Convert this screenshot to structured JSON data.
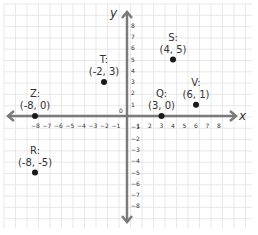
{
  "figure": {
    "x_axis_label": "x",
    "y_axis_label": "y",
    "origin_label": "0",
    "x_ticks": [
      -8,
      -7,
      -6,
      -5,
      -4,
      -3,
      -2,
      -1,
      1,
      2,
      3,
      4,
      5,
      6,
      7,
      8
    ],
    "y_ticks": [
      8,
      7,
      6,
      5,
      4,
      3,
      2,
      1,
      -1,
      -2,
      -3,
      -4,
      -5,
      -6,
      -7,
      -8
    ],
    "axis_color": "#7a7a7a",
    "grid_color": "#e2e2e2",
    "point_color": "#1a1a1a"
  },
  "points": [
    {
      "name": "Z:",
      "coord": "(-8, 0)",
      "x": -8,
      "y": 0
    },
    {
      "name": "T:",
      "coord": "(-2, 3)",
      "x": -2,
      "y": 3
    },
    {
      "name": "S:",
      "coord": "(4, 5)",
      "x": 4,
      "y": 5
    },
    {
      "name": "Q:",
      "coord": "(3, 0)",
      "x": 3,
      "y": 0
    },
    {
      "name": "V:",
      "coord": "(6, 1)",
      "x": 6,
      "y": 1
    },
    {
      "name": "R:",
      "coord": "(-8, -5)",
      "x": -8,
      "y": -5
    }
  ]
}
